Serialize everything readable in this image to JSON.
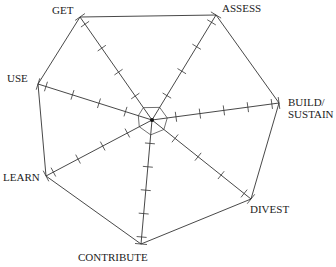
{
  "diagram": {
    "type": "radial-cycle",
    "center": [
      152,
      120
    ],
    "stroke_color": "#333333",
    "nodes": [
      {
        "id": "get",
        "label": "GET",
        "vertex": [
          80,
          17
        ],
        "ticks": 4
      },
      {
        "id": "assess",
        "label": "ASSESS",
        "vertex": [
          216,
          15
        ],
        "ticks": 4
      },
      {
        "id": "build",
        "label": "BUILD/\nSUSTAIN",
        "line1": "BUILD/",
        "line2": "SUSTAIN",
        "vertex": [
          279,
          103
        ],
        "ticks": 5
      },
      {
        "id": "divest",
        "label": "DIVEST",
        "vertex": [
          251,
          199
        ],
        "ticks": 4
      },
      {
        "id": "contribute",
        "label": "CONTRIBUTE",
        "vertex": [
          141,
          244
        ],
        "ticks": 5
      },
      {
        "id": "learn",
        "label": "LEARN",
        "vertex": [
          46,
          176
        ],
        "ticks": 4
      },
      {
        "id": "use",
        "label": "USE",
        "vertex": [
          38,
          84
        ],
        "ticks": 4
      }
    ]
  },
  "labels": {
    "get": "GET",
    "assess": "ASSESS",
    "build1": "BUILD/",
    "build2": "SUSTAIN",
    "divest": "DIVEST",
    "contribute": "CONTRIBUTE",
    "learn": "LEARN",
    "use": "USE"
  },
  "footer": "Prof. ... Wil... ..."
}
